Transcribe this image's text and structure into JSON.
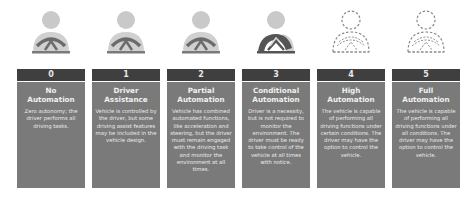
{
  "colors": {
    "level_bar": "#3f3f3f",
    "box": "#7a7a7a",
    "icon_fill": "#c7c7c7",
    "icon_dark": "#555555"
  },
  "levels": [
    {
      "number": "0",
      "title_line1": "No",
      "title_line2": "Automation",
      "description": "Zero autonomy; the driver performs all driving tasks.",
      "icon": "driver-solid-icon"
    },
    {
      "number": "1",
      "title_line1": "Driver",
      "title_line2": "Assistance",
      "description": "Vehicle is controlled by the driver, but some driving assist features may be included in the vehicle design.",
      "icon": "driver-solid-icon"
    },
    {
      "number": "2",
      "title_line1": "Partial",
      "title_line2": "Automation",
      "description": "Vehicle has combined automated functions, like acceleration and steering, but the driver must remain engaged with the driving task and monitor the environment at all times.",
      "icon": "driver-solid-icon"
    },
    {
      "number": "3",
      "title_line1": "Conditional",
      "title_line2": "Automation",
      "description": "Driver is a necessity, but is not required to monitor the environment. The driver must be ready to take control of the vehicle at all times with notice.",
      "icon": "driver-wheel-dark-icon"
    },
    {
      "number": "4",
      "title_line1": "High",
      "title_line2": "Automation",
      "description": "The vehicle is capable of performing all driving functions under certain conditions. The driver may have the option to control the vehicle.",
      "icon": "driver-dashed-icon"
    },
    {
      "number": "5",
      "title_line1": "Full",
      "title_line2": "Automation",
      "description": "The vehicle is capable of performing all driving functions under all conditions. The driver may have the option to control the vehicle.",
      "icon": "driver-dashed-icon"
    }
  ]
}
